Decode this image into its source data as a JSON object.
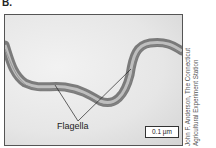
{
  "panel_label": "B.",
  "figure": {
    "annotation_label": "Flagella",
    "scale_bar": "0.1 µm"
  },
  "credit": {
    "line1": "John F. Anderson, The Connecticut",
    "line2": "Agricultural Experiment Station"
  }
}
